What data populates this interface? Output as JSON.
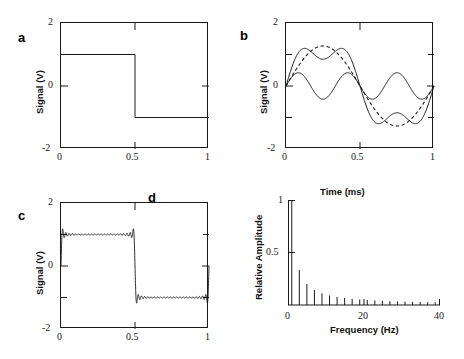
{
  "figure": {
    "panels": [
      "a",
      "b",
      "c",
      "d"
    ]
  },
  "panel_a": {
    "letter": "a",
    "ylabel": "Signal (V)",
    "xticks": [
      "0",
      "0.5",
      "1"
    ],
    "yticks": [
      "2",
      "0",
      "-2"
    ],
    "xlim": [
      0,
      1
    ],
    "ylim": [
      -2,
      2
    ],
    "frame": "box"
  },
  "panel_b": {
    "letter": "b",
    "ylabel": "Signal (V)",
    "xlabel": "Time (ms)",
    "xticks": [
      "0",
      "0.5",
      "1"
    ],
    "yticks": [
      "2",
      "0",
      "-2"
    ],
    "xlim": [
      0,
      1
    ],
    "ylim": [
      -2,
      2
    ],
    "frame": "box"
  },
  "panel_c": {
    "letter": "c",
    "letter_d": "d",
    "ylabel": "Signal (V)",
    "xticks": [
      "0",
      "0.5",
      "1"
    ],
    "yticks": [
      "2",
      "0",
      "-2"
    ],
    "xlim": [
      0,
      1
    ],
    "ylim": [
      -2,
      2
    ],
    "frame": "box"
  },
  "panel_d": {
    "ylabel": "Relative Amplitude",
    "xlabel": "Frequency (Hz)",
    "xticks": [
      "0",
      "20",
      "40"
    ],
    "yticks": [
      "1",
      "0.5"
    ],
    "xlim": [
      0,
      40
    ],
    "ylim": [
      0,
      1
    ],
    "frame": "left-bottom"
  },
  "chart_data": [
    {
      "id": "a",
      "type": "line",
      "title": "",
      "xlabel": "",
      "ylabel": "Signal (V)",
      "xlim": [
        0,
        1
      ],
      "ylim": [
        -2,
        2
      ],
      "xticks": [
        0,
        0.5,
        1
      ],
      "yticks": [
        -2,
        0,
        2
      ],
      "grid": false,
      "legend": "none",
      "series": [
        {
          "name": "square wave",
          "style": "solid",
          "x": [
            0,
            0.5,
            0.5,
            1
          ],
          "y": [
            1,
            1,
            -1,
            -1
          ]
        }
      ]
    },
    {
      "id": "b",
      "type": "line",
      "title": "",
      "xlabel": "Time (ms)",
      "ylabel": "Signal (V)",
      "xlim": [
        0,
        1
      ],
      "ylim": [
        -2,
        2
      ],
      "xticks": [
        0,
        0.5,
        1
      ],
      "yticks": [
        -2,
        0,
        2
      ],
      "grid": false,
      "legend": "none",
      "series": [
        {
          "name": "fundamental (1 Hz)",
          "style": "dashed",
          "formula": "1.273*sin(2*pi*x)",
          "amplitude": 1.27,
          "harmonic": 1
        },
        {
          "name": "third harmonic (3 Hz)",
          "style": "solid",
          "formula": "0.424*sin(6*pi*x)",
          "amplitude": 0.42,
          "harmonic": 3
        },
        {
          "name": "sum of harmonics 1 and 3",
          "style": "solid",
          "formula": "1.273*sin(2*pi*x)+0.424*sin(6*pi*x)",
          "peak": 1.2
        }
      ]
    },
    {
      "id": "c",
      "type": "line",
      "title": "",
      "xlabel": "",
      "ylabel": "Signal (V)",
      "xlim": [
        0,
        1
      ],
      "ylim": [
        -2,
        2
      ],
      "xticks": [
        0,
        0.5,
        1
      ],
      "yticks": [
        -2,
        0,
        2
      ],
      "grid": false,
      "legend": "none",
      "series": [
        {
          "name": "partial Fourier sum (odd harmonics 1..45) with Gibbs ripple",
          "style": "solid",
          "harmonics": 23,
          "overshoot": 1.18
        }
      ]
    },
    {
      "id": "d",
      "type": "bar",
      "title": "",
      "xlabel": "Frequency (Hz)",
      "ylabel": "Relative Amplitude",
      "xlim": [
        0,
        40
      ],
      "ylim": [
        0,
        1
      ],
      "xticks": [
        0,
        20,
        40
      ],
      "yticks": [
        0.5,
        1
      ],
      "grid": false,
      "legend": "none",
      "categories": [
        1,
        3,
        5,
        7,
        9,
        11,
        13,
        15,
        17,
        19,
        21,
        23,
        25,
        27,
        29,
        31,
        33,
        35,
        37,
        39
      ],
      "values": [
        1.0,
        0.333,
        0.2,
        0.143,
        0.111,
        0.091,
        0.077,
        0.067,
        0.059,
        0.053,
        0.048,
        0.043,
        0.04,
        0.037,
        0.034,
        0.032,
        0.03,
        0.029,
        0.027,
        0.026
      ]
    }
  ]
}
